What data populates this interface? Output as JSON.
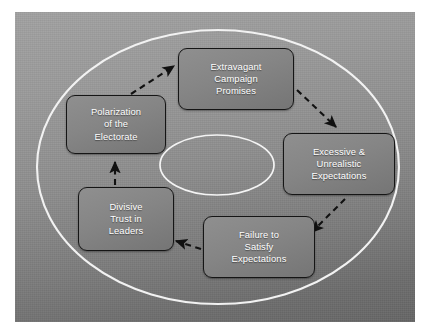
{
  "diagram": {
    "type": "cycle",
    "title": "",
    "background_color": "#8e8e8e",
    "panel": {
      "x": 15,
      "y": 12,
      "width": 400,
      "height": 310
    },
    "outer_ring": {
      "shape": "ellipse",
      "stroke_color": "#ffffff",
      "cx": 218,
      "cy": 167,
      "rx": 181,
      "ry": 137
    },
    "inner_ring": {
      "shape": "ellipse",
      "stroke_color": "#ffffff",
      "label": "",
      "cx": 217,
      "cy": 165,
      "rx": 57,
      "ry": 30
    },
    "node_fill": "#858585",
    "node_border": "#151515",
    "node_text_color": "#ffffff",
    "arrow_color": "#111111",
    "arrow_style": "dashed",
    "nodes": [
      {
        "id": "promises",
        "lines": [
          "Extravagant",
          "Campaign",
          "Promises"
        ]
      },
      {
        "id": "excess",
        "lines": [
          "Excessive &",
          "Unrealistic",
          "Expectations"
        ]
      },
      {
        "id": "failure",
        "lines": [
          "Failure to",
          "Satisfy",
          "Expectations"
        ]
      },
      {
        "id": "divisive",
        "lines": [
          "Divisive",
          "Trust in",
          "Leaders"
        ]
      },
      {
        "id": "polar",
        "lines": [
          "Polarization",
          "of the",
          "Electorate"
        ]
      }
    ],
    "edges": [
      {
        "from": "polar",
        "to": "promises"
      },
      {
        "from": "promises",
        "to": "excess"
      },
      {
        "from": "excess",
        "to": "failure"
      },
      {
        "from": "failure",
        "to": "divisive"
      },
      {
        "from": "divisive",
        "to": "polar"
      }
    ]
  }
}
